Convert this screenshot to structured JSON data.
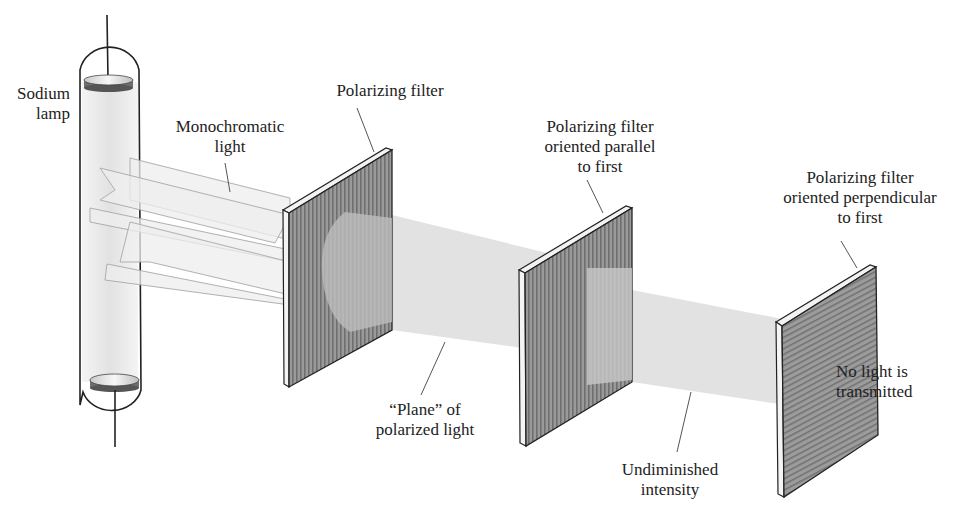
{
  "figure": {
    "components": [
      {
        "id": "sodium-lamp",
        "label_lines": [
          "Sodium",
          "lamp"
        ]
      },
      {
        "id": "monochromatic-light",
        "label_lines": [
          "Monochromatic",
          "light"
        ]
      },
      {
        "id": "filter-1",
        "label_lines": [
          "Polarizing filter"
        ],
        "line_orientation": "vertical"
      },
      {
        "id": "plane-polarized",
        "label_lines": [
          "“Plane” of",
          "polarized light"
        ]
      },
      {
        "id": "filter-2",
        "label_lines": [
          "Polarizing filter",
          "oriented parallel",
          "to first"
        ],
        "line_orientation": "vertical"
      },
      {
        "id": "undiminished",
        "label_lines": [
          "Undiminished",
          "intensity"
        ]
      },
      {
        "id": "filter-3",
        "label_lines": [
          "Polarizing filter",
          "oriented perpendicular",
          "to first"
        ],
        "line_orientation": "horizontal"
      },
      {
        "id": "no-light",
        "label_lines": [
          "No light is",
          "transmitted"
        ]
      }
    ]
  },
  "labels": {
    "lamp": {
      "l1": "Sodium",
      "l2": "lamp"
    },
    "mono": {
      "l1": "Monochromatic",
      "l2": "light"
    },
    "filter1": {
      "l1": "Polarizing filter"
    },
    "plane": {
      "l1": "“Plane” of",
      "l2": "polarized light"
    },
    "filter2": {
      "l1": "Polarizing filter",
      "l2": "oriented parallel",
      "l3": "to first"
    },
    "undiminished": {
      "l1": "Undiminished",
      "l2": "intensity"
    },
    "filter3": {
      "l1": "Polarizing filter",
      "l2": "oriented perpendicular",
      "l3": "to first"
    },
    "nolight": {
      "l1": "No light is",
      "l2": "transmitted"
    }
  },
  "colors": {
    "filter_face": "#8a8a8a",
    "filter_edge": "#f2f2f2",
    "beam": "#e3e3e3",
    "lamp_glow": "#ececec",
    "outline": "#222222"
  }
}
